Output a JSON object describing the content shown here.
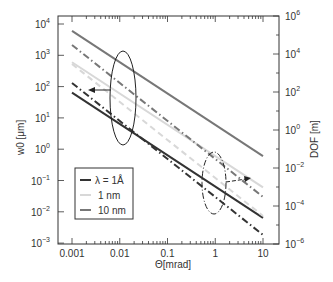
{
  "chart_data": {
    "type": "line",
    "title": "",
    "xlabel": "Θ[mrad]",
    "ylabel_left": "w0 [μm]",
    "ylabel_right": "DOF [m]",
    "xscale": "log",
    "yscale_left": "log",
    "yscale_right": "log",
    "xlim": [
      0.001,
      10
    ],
    "ylim_left": [
      0.001,
      10000
    ],
    "ylim_right": [
      1e-06,
      1000000
    ],
    "x_ticks": [
      "0.001",
      "0.01",
      "0.1",
      "1",
      "10"
    ],
    "y_left_ticks": [
      "10^4",
      "10^3",
      "10^2",
      "10^1",
      "10^0",
      "10^-1",
      "10^-2",
      "10^-3"
    ],
    "y_right_ticks": [
      "10^6",
      "10^4",
      "10^2",
      "10^0",
      "10^-2",
      "10^-4",
      "10^-6"
    ],
    "grid": false,
    "legend_position": "lower-left inside",
    "legend": [
      {
        "label": "λ = 1Å",
        "color": "#333333"
      },
      {
        "label": "1 nm",
        "color": "#d8d8d8"
      },
      {
        "label": "10 nm",
        "color": "#777777"
      }
    ],
    "x": [
      0.001,
      10
    ],
    "series": [
      {
        "name": "w0, 10 nm",
        "axis": "left",
        "style": "solid",
        "color": "#777777",
        "values": [
          6000,
          0.6
        ]
      },
      {
        "name": "w0, 1 nm",
        "axis": "left",
        "style": "solid",
        "color": "#d8d8d8",
        "values": [
          600,
          0.06
        ]
      },
      {
        "name": "w0, λ = 1Å",
        "axis": "left",
        "style": "solid",
        "color": "#333333",
        "values": [
          64,
          0.0064
        ]
      },
      {
        "name": "DOF, 10 nm",
        "axis": "right",
        "style": "dash-dot",
        "color": "#777777",
        "values": [
          30000,
          0.0003
        ]
      },
      {
        "name": "DOF, 1 nm",
        "axis": "right",
        "style": "dashed",
        "color": "#d8d8d8",
        "values": [
          3000,
          3e-05
        ]
      },
      {
        "name": "DOF, λ = 1Å",
        "axis": "right",
        "style": "dash-dot",
        "color": "#333333",
        "values": [
          300,
          3e-06
        ]
      }
    ],
    "annotations": [
      {
        "type": "ellipse-solid",
        "arrow": "left",
        "meaning": "w0 curves refer to left axis"
      },
      {
        "type": "ellipse-dash-dot",
        "arrow": "right",
        "meaning": "DOF curves refer to right axis"
      }
    ]
  },
  "labels": {
    "xlabel": "Θ[mrad]",
    "ylabel_left": "w0 [μm]",
    "ylabel_right": "DOF [m]",
    "legend_1": "λ = 1Å",
    "legend_2": "1 nm",
    "legend_3": "10 nm"
  }
}
